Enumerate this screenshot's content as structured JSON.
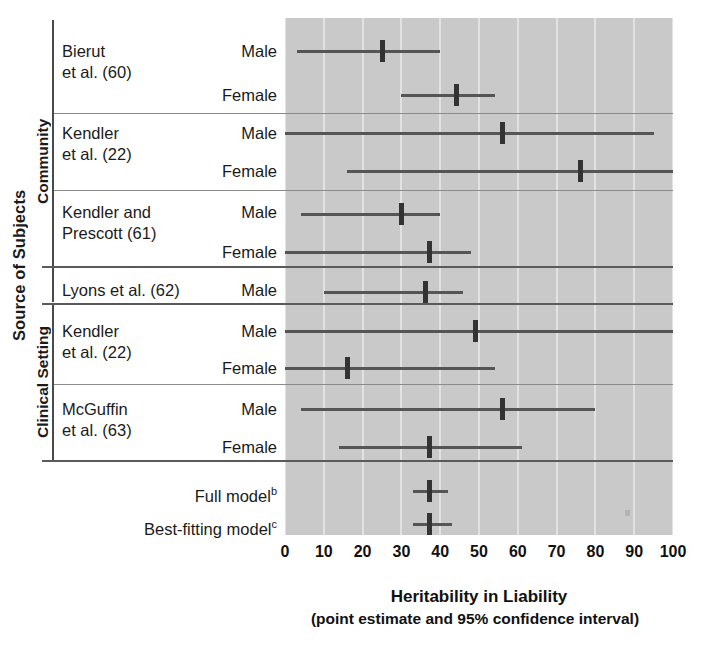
{
  "figure": {
    "y_axis_title": "Source of Subjects",
    "x_axis_title": "Heritability in Liability",
    "x_axis_subtitle": "(point estimate and 95% confidence interval)"
  },
  "groups": [
    {
      "label": "Community"
    },
    {
      "label": "Clinical Setting"
    }
  ],
  "studies": [
    {
      "name_line1": "Bierut",
      "name_line2": "et al. (60)"
    },
    {
      "name_line1": "Kendler",
      "name_line2": "et al. (22)"
    },
    {
      "name_line1": "Kendler and",
      "name_line2": "Prescott (61)"
    },
    {
      "name_line1": "Lyons et al. (62)",
      "name_line2": ""
    },
    {
      "name_line1": "Kendler",
      "name_line2": "et al. (22)"
    },
    {
      "name_line1": "McGuffin",
      "name_line2": "et al. (63)"
    }
  ],
  "sex_labels": {
    "male": "Male",
    "female": "Female"
  },
  "summary_rows": [
    {
      "label": "Full model",
      "superscript": "b"
    },
    {
      "label": "Best-fitting model",
      "superscript": "c"
    }
  ],
  "chart_data": {
    "type": "forest",
    "title": "Heritability in Liability",
    "subtitle": "(point estimate and 95% confidence interval)",
    "xlabel": "Heritability in Liability",
    "ylabel": "Source of Subjects",
    "xlim": [
      0,
      100
    ],
    "xticks": [
      0,
      10,
      20,
      30,
      40,
      50,
      60,
      70,
      80,
      90,
      100
    ],
    "xtick_labels": [
      "0",
      "10",
      "20",
      "30",
      "40",
      "50",
      "60",
      "70",
      "80",
      "90",
      "100"
    ],
    "grid": true,
    "legend": "none",
    "plot_bgcolor": "#c9c9c9",
    "gridline_color": "#e2e2e2",
    "marker_color": "#333333",
    "line_color": "#555555",
    "rows": [
      {
        "group": "Community",
        "study": "Bierut et al. (60)",
        "sex": "Male",
        "estimate": 25,
        "ci_low": 3,
        "ci_high": 40
      },
      {
        "group": "Community",
        "study": "Bierut et al. (60)",
        "sex": "Female",
        "estimate": 44,
        "ci_low": 30,
        "ci_high": 54
      },
      {
        "group": "Community",
        "study": "Kendler et al. (22)",
        "sex": "Male",
        "estimate": 56,
        "ci_low": 0,
        "ci_high": 95
      },
      {
        "group": "Community",
        "study": "Kendler et al. (22)",
        "sex": "Female",
        "estimate": 76,
        "ci_low": 16,
        "ci_high": 100
      },
      {
        "group": "Community",
        "study": "Kendler and Prescott (61)",
        "sex": "Male",
        "estimate": 30,
        "ci_low": 4,
        "ci_high": 40
      },
      {
        "group": "Community",
        "study": "Kendler and Prescott (61)",
        "sex": "Female",
        "estimate": 37,
        "ci_low": 0,
        "ci_high": 48
      },
      {
        "group": "Community",
        "study": "Lyons et al. (62)",
        "sex": "Male",
        "estimate": 36,
        "ci_low": 10,
        "ci_high": 46
      },
      {
        "group": "Clinical Setting",
        "study": "Kendler et al. (22)",
        "sex": "Male",
        "estimate": 49,
        "ci_low": 0,
        "ci_high": 100
      },
      {
        "group": "Clinical Setting",
        "study": "Kendler et al. (22)",
        "sex": "Female",
        "estimate": 16,
        "ci_low": 0,
        "ci_high": 54
      },
      {
        "group": "Clinical Setting",
        "study": "McGuffin et al. (63)",
        "sex": "Male",
        "estimate": 56,
        "ci_low": 4,
        "ci_high": 80
      },
      {
        "group": "Clinical Setting",
        "study": "McGuffin et al. (63)",
        "sex": "Female",
        "estimate": 37,
        "ci_low": 14,
        "ci_high": 61
      },
      {
        "group": "Summary",
        "study": "Full model",
        "sex": "",
        "estimate": 37,
        "ci_low": 33,
        "ci_high": 42
      },
      {
        "group": "Summary",
        "study": "Best-fitting model",
        "sex": "",
        "estimate": 37,
        "ci_low": 33,
        "ci_high": 43
      }
    ]
  },
  "_layout": {
    "panel_left": 285,
    "panel_top": 18,
    "panel_width": 388,
    "panel_height": 517,
    "row_y": [
      40,
      84,
      122,
      160,
      203,
      241,
      281,
      320,
      357,
      398,
      436,
      480,
      513
    ],
    "separators_y": [
      113,
      190,
      266,
      303,
      384,
      460
    ],
    "group_brackets": [
      {
        "top": 20,
        "height": 282,
        "label_top": 20,
        "label_height": 282
      },
      {
        "top": 306,
        "height": 154,
        "label_top": 306,
        "label_height": 154
      }
    ]
  }
}
